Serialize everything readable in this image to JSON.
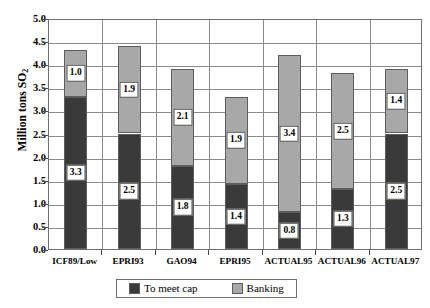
{
  "chart_data": {
    "type": "bar",
    "subtype": "stacked",
    "title": "",
    "xlabel": "",
    "ylabel": "Million tons SO2",
    "ylabel_base": "Million tons SO",
    "ylabel_sub": "2",
    "ylim": [
      0.0,
      5.0
    ],
    "ytick_step": 0.5,
    "ytick_labels": [
      "0.0",
      "0.5",
      "1.0",
      "1.5",
      "2.0",
      "2.5",
      "3.0",
      "3.5",
      "4.0",
      "4.5",
      "5.0"
    ],
    "ytick_values": [
      0.0,
      0.5,
      1.0,
      1.5,
      2.0,
      2.5,
      3.0,
      3.5,
      4.0,
      4.5,
      5.0
    ],
    "grid": true,
    "legend_position": "bottom",
    "categories": [
      "ICF89/Low",
      "EPRI93",
      "GAO94",
      "EPRI95",
      "ACTUAL95",
      "ACTUAL96",
      "ACTUAL97"
    ],
    "series": [
      {
        "name": "To meet cap",
        "color": "#3a3a3a",
        "values": [
          3.3,
          2.5,
          1.8,
          1.4,
          0.8,
          1.3,
          2.5
        ],
        "labels": [
          "3.3",
          "2.5",
          "1.8",
          "1.4",
          "0.8",
          "1.3",
          "2.5"
        ]
      },
      {
        "name": "Banking",
        "color": "#a8a8a8",
        "values": [
          1.0,
          1.9,
          2.1,
          1.9,
          3.4,
          2.5,
          1.4
        ],
        "labels": [
          "1.0",
          "1.9",
          "2.1",
          "1.9",
          "3.4",
          "2.5",
          "1.4"
        ]
      }
    ],
    "totals": [
      4.3,
      4.4,
      3.9,
      3.3,
      4.2,
      3.8,
      3.9
    ]
  },
  "legend": {
    "items": [
      {
        "label": "To meet cap",
        "color": "#3a3a3a"
      },
      {
        "label": "Banking",
        "color": "#a8a8a8"
      }
    ]
  }
}
